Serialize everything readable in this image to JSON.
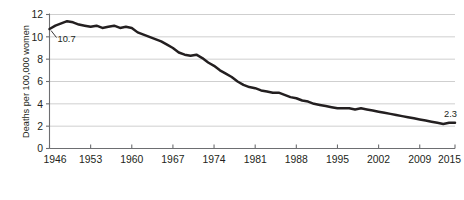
{
  "chart_data": {
    "type": "line",
    "title": "",
    "xlabel": "",
    "ylabel": "Deaths per 100,000 women",
    "xlim": [
      1946,
      2015
    ],
    "ylim": [
      0,
      12
    ],
    "yticks": [
      0,
      2,
      4,
      6,
      8,
      10,
      12
    ],
    "xticks": [
      1946,
      1953,
      1960,
      1967,
      1974,
      1981,
      1988,
      1995,
      2002,
      2009,
      2015
    ],
    "grid": "horizontal",
    "legend": "none",
    "series_color": "#231f20",
    "gridline_color": "#c9c9c9",
    "axis_color": "#6d6e71",
    "annotations": [
      {
        "label": "10.7",
        "x": 1946,
        "y": 10.7
      },
      {
        "label": "2.3",
        "x": 2015,
        "y": 2.3
      }
    ],
    "x": [
      1946,
      1947,
      1948,
      1949,
      1950,
      1951,
      1952,
      1953,
      1954,
      1955,
      1956,
      1957,
      1958,
      1959,
      1960,
      1961,
      1962,
      1963,
      1964,
      1965,
      1966,
      1967,
      1968,
      1969,
      1970,
      1971,
      1972,
      1973,
      1974,
      1975,
      1976,
      1977,
      1978,
      1979,
      1980,
      1981,
      1982,
      1983,
      1984,
      1985,
      1986,
      1987,
      1988,
      1989,
      1990,
      1991,
      1992,
      1993,
      1994,
      1995,
      1996,
      1997,
      1998,
      1999,
      2000,
      2001,
      2002,
      2003,
      2004,
      2005,
      2006,
      2007,
      2008,
      2009,
      2010,
      2011,
      2012,
      2013,
      2014,
      2015
    ],
    "values": [
      10.7,
      11.0,
      11.2,
      11.4,
      11.3,
      11.1,
      11.0,
      10.9,
      11.0,
      10.8,
      10.9,
      11.0,
      10.8,
      10.9,
      10.8,
      10.4,
      10.2,
      10.0,
      9.8,
      9.6,
      9.3,
      9.0,
      8.6,
      8.4,
      8.3,
      8.4,
      8.1,
      7.7,
      7.4,
      7.0,
      6.7,
      6.4,
      6.0,
      5.7,
      5.5,
      5.4,
      5.2,
      5.1,
      5.0,
      5.0,
      4.8,
      4.6,
      4.5,
      4.3,
      4.2,
      4.0,
      3.9,
      3.8,
      3.7,
      3.6,
      3.6,
      3.6,
      3.5,
      3.6,
      3.5,
      3.4,
      3.3,
      3.2,
      3.1,
      3.0,
      2.9,
      2.8,
      2.7,
      2.6,
      2.5,
      2.4,
      2.3,
      2.2,
      2.3,
      2.3
    ]
  }
}
